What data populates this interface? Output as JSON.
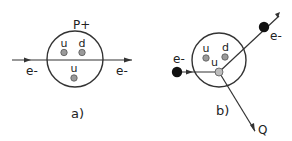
{
  "panels": [
    {
      "id": "a",
      "caption": "a)",
      "proton_label": "P+",
      "electron_in_label": "e-",
      "electron_out_label": "e-",
      "quarks": [
        "u",
        "d",
        "u"
      ]
    },
    {
      "id": "b",
      "caption": "b)",
      "electron_in_label": "e-",
      "electron_out_label": "e-",
      "recoil_label": "Q",
      "quarks": [
        "u",
        "d",
        "u"
      ]
    }
  ],
  "colors": {
    "line": "#333333",
    "quark_fill": "#9a9a9a",
    "struck_quark_fill": "#bdbdbd",
    "electron_fill": "#111111"
  }
}
